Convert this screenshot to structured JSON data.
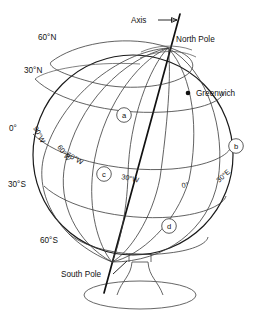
{
  "figure": {
    "type": "diagram",
    "background_color": "#ffffff",
    "line_color": "#333333"
  },
  "annotations": {
    "axis": "Axis",
    "north_pole": "North Pole",
    "south_pole": "South Pole",
    "greenwich": "Greenwich"
  },
  "latitudes": [
    {
      "id": "lat-60n",
      "label": "60°N"
    },
    {
      "id": "lat-30n",
      "label": "30°N"
    },
    {
      "id": "lat-0",
      "label": "0°"
    },
    {
      "id": "lat-30s",
      "label": "30°S"
    },
    {
      "id": "lat-60s",
      "label": "60°S"
    }
  ],
  "longitudes": [
    {
      "id": "lon-90w",
      "label": "90°W"
    },
    {
      "id": "lon-60w",
      "label": "60°W"
    },
    {
      "id": "lon-60w-2",
      "label": "60°W"
    },
    {
      "id": "lon-30w",
      "label": "30°W"
    },
    {
      "id": "lon-0",
      "label": "0°"
    },
    {
      "id": "lon-30e",
      "label": "30°E"
    }
  ],
  "markers": [
    {
      "id": "marker-a",
      "label": "a"
    },
    {
      "id": "marker-b",
      "label": "b"
    },
    {
      "id": "marker-c",
      "label": "c"
    },
    {
      "id": "marker-d",
      "label": "d"
    }
  ]
}
